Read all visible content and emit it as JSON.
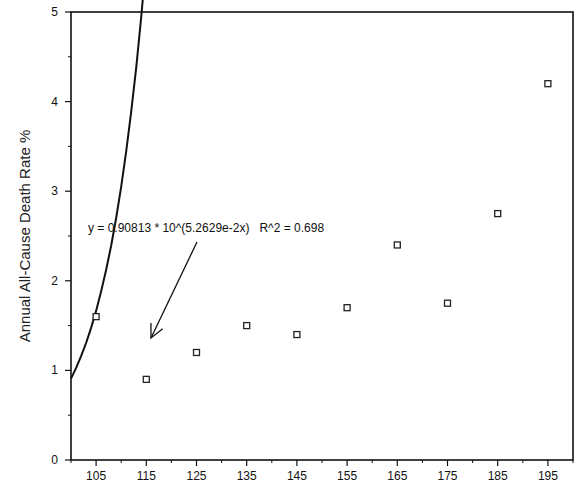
{
  "chart_data": {
    "type": "scatter",
    "title": "",
    "xlabel": "",
    "ylabel": "Annual All-Cause Death Rate %",
    "xlim": [
      100,
      200
    ],
    "ylim": [
      0,
      5
    ],
    "x_ticks": [
      105,
      115,
      125,
      135,
      145,
      155,
      165,
      175,
      185,
      195
    ],
    "x_minor_ticks": [
      100,
      110,
      120,
      130,
      140,
      150,
      160,
      170,
      180,
      190,
      200
    ],
    "y_ticks": [
      0,
      1,
      2,
      3,
      4,
      5
    ],
    "y_minor_ticks": [
      0.5,
      1.5,
      2.5,
      3.5,
      4.5
    ],
    "grid": false,
    "legend": null,
    "series": [
      {
        "name": "observed",
        "marker": "open-square",
        "x": [
          105,
          115,
          125,
          135,
          145,
          155,
          165,
          175,
          185,
          195
        ],
        "y": [
          1.6,
          0.9,
          1.2,
          1.5,
          1.4,
          1.7,
          2.4,
          1.75,
          2.75,
          4.2
        ]
      }
    ],
    "fit": {
      "type": "exponential",
      "a": 0.90813,
      "b": 0.052629,
      "x_offset": 100,
      "r_squared": 0.698,
      "x_range": [
        100,
        200
      ]
    },
    "annotations": [
      {
        "text": "y = 0.90813 * 10^(5.2629e-2x)   R^2 = 0.698",
        "text_pos": [
          88,
          232
        ],
        "arrow_from": [
          197,
          242
        ],
        "arrow_to": [
          151,
          338
        ]
      }
    ]
  },
  "colors": {
    "axis": "#111111",
    "marker": "#222222",
    "fit_line": "#111111",
    "background": "#ffffff"
  }
}
